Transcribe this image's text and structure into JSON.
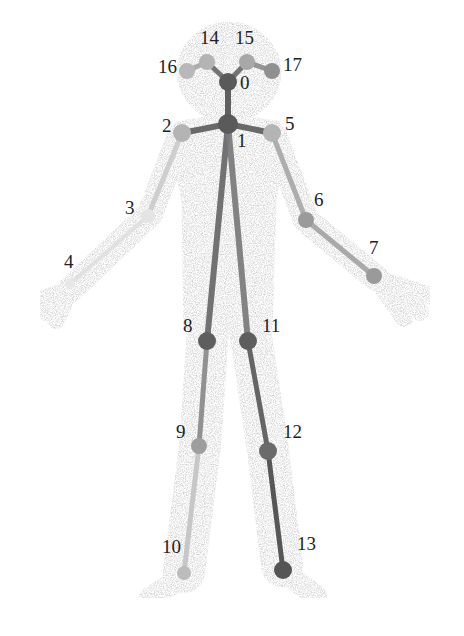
{
  "figure": {
    "colors": {
      "silhouette": "#d4d4d4",
      "dark": "#5a5a5a",
      "mid": "#8a8a8a",
      "light": "#b0b0b0",
      "faint": "#d0d0d0"
    },
    "keypoints": [
      {
        "id": "0",
        "label": "0",
        "x": 228,
        "y": 82,
        "lx": 240,
        "ly": 83,
        "fill": "#5a5a5a",
        "r": 9
      },
      {
        "id": "1",
        "label": "1",
        "x": 228,
        "y": 124,
        "lx": 237,
        "ly": 141,
        "fill": "#5a5a5a",
        "r": 10
      },
      {
        "id": "2",
        "label": "2",
        "x": 182,
        "y": 133,
        "lx": 162,
        "ly": 126,
        "fill": "#b4b4b4",
        "r": 9
      },
      {
        "id": "3",
        "label": "3",
        "x": 148,
        "y": 216,
        "lx": 125,
        "ly": 208,
        "fill": "#e4e4e4",
        "r": 7
      },
      {
        "id": "4",
        "label": "4",
        "x": 70,
        "y": 284,
        "lx": 64,
        "ly": 262,
        "fill": "#e8e8e8",
        "r": 5
      },
      {
        "id": "5",
        "label": "5",
        "x": 272,
        "y": 133,
        "lx": 285,
        "ly": 124,
        "fill": "#b4b4b4",
        "r": 9
      },
      {
        "id": "6",
        "label": "6",
        "x": 306,
        "y": 220,
        "lx": 314,
        "ly": 200,
        "fill": "#9a9a9a",
        "r": 8
      },
      {
        "id": "7",
        "label": "7",
        "x": 374,
        "y": 276,
        "lx": 369,
        "ly": 248,
        "fill": "#9a9a9a",
        "r": 8
      },
      {
        "id": "8",
        "label": "8",
        "x": 207,
        "y": 341,
        "lx": 183,
        "ly": 326,
        "fill": "#5e5e5e",
        "r": 9
      },
      {
        "id": "9",
        "label": "9",
        "x": 199,
        "y": 446,
        "lx": 176,
        "ly": 432,
        "fill": "#9e9e9e",
        "r": 8
      },
      {
        "id": "10",
        "label": "10",
        "x": 184,
        "y": 573,
        "lx": 162,
        "ly": 547,
        "fill": "#bcbcbc",
        "r": 7
      },
      {
        "id": "11",
        "label": "11",
        "x": 248,
        "y": 341,
        "lx": 262,
        "ly": 326,
        "fill": "#5e5e5e",
        "r": 9
      },
      {
        "id": "12",
        "label": "12",
        "x": 268,
        "y": 451,
        "lx": 283,
        "ly": 432,
        "fill": "#6a6a6a",
        "r": 9
      },
      {
        "id": "13",
        "label": "13",
        "x": 283,
        "y": 570,
        "lx": 297,
        "ly": 544,
        "fill": "#555555",
        "r": 9
      },
      {
        "id": "14",
        "label": "14",
        "x": 207,
        "y": 62,
        "lx": 200,
        "ly": 38,
        "fill": "#b4b4b4",
        "r": 8
      },
      {
        "id": "15",
        "label": "15",
        "x": 247,
        "y": 62,
        "lx": 235,
        "ly": 38,
        "fill": "#a8a8a8",
        "r": 8
      },
      {
        "id": "16",
        "label": "16",
        "x": 187,
        "y": 71,
        "lx": 158,
        "ly": 67,
        "fill": "#b8b8b8",
        "r": 8
      },
      {
        "id": "17",
        "label": "17",
        "x": 272,
        "y": 71,
        "lx": 283,
        "ly": 65,
        "fill": "#909090",
        "r": 8
      }
    ],
    "limbs": [
      {
        "from": 0,
        "to": 1,
        "color": "#555555",
        "w": 6
      },
      {
        "from": 0,
        "to": 14,
        "color": "#6a6a6a",
        "w": 5
      },
      {
        "from": 0,
        "to": 15,
        "color": "#6a6a6a",
        "w": 5
      },
      {
        "from": 14,
        "to": 16,
        "color": "#a8a8a8",
        "w": 5
      },
      {
        "from": 15,
        "to": 17,
        "color": "#8e8e8e",
        "w": 5
      },
      {
        "from": 1,
        "to": 2,
        "color": "#5e5e5e",
        "w": 6
      },
      {
        "from": 1,
        "to": 5,
        "color": "#5e5e5e",
        "w": 6
      },
      {
        "from": 2,
        "to": 3,
        "color": "#cccccc",
        "w": 5
      },
      {
        "from": 3,
        "to": 4,
        "color": "#e0e0e0",
        "w": 4
      },
      {
        "from": 5,
        "to": 6,
        "color": "#a8a8a8",
        "w": 5
      },
      {
        "from": 6,
        "to": 7,
        "color": "#a4a4a4",
        "w": 5
      },
      {
        "from": 1,
        "to": 8,
        "color": "#686868",
        "w": 6
      },
      {
        "from": 1,
        "to": 11,
        "color": "#7a7a7a",
        "w": 6
      },
      {
        "from": 8,
        "to": 9,
        "color": "#8a8a8a",
        "w": 5
      },
      {
        "from": 9,
        "to": 10,
        "color": "#c4c4c4",
        "w": 5
      },
      {
        "from": 11,
        "to": 12,
        "color": "#5a5a5a",
        "w": 5
      },
      {
        "from": 12,
        "to": 13,
        "color": "#4a4a4a",
        "w": 5
      }
    ]
  }
}
